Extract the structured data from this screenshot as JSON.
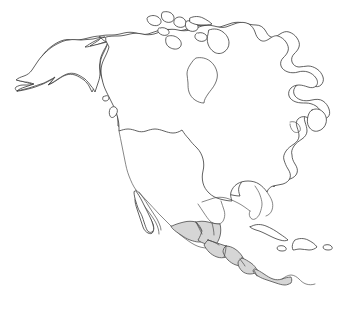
{
  "figure": {
    "type": "blank-political-map",
    "width": 346,
    "height": 320,
    "background_color": "#ffffff",
    "outline_color": "#3a3a3a",
    "highlight_color": "#d6d6d6",
    "border_color": "#555555",
    "projection_note": "continental outline, no labels"
  },
  "legend": {
    "has_legend": false,
    "has_labels": false,
    "has_title_text": false,
    "has_scale_bar": false,
    "has_compass": false,
    "has_graticule": false
  },
  "regions": [
    {
      "id": "alaska",
      "name": "Alaska",
      "shaded": false,
      "note": "northwest landmass with Aleutian peninsula tail extending southwest"
    },
    {
      "id": "canada",
      "name": "Canada",
      "shaded": false,
      "note": "largest northern landmass containing Hudson Bay"
    },
    {
      "id": "united-states",
      "name": "United States",
      "shaded": false,
      "note": "separated from Canada by straight 49th parallel border line"
    },
    {
      "id": "mexico",
      "name": "Mexico",
      "shaded": false,
      "note": "includes Baja California peninsula and Yucatan peninsula"
    },
    {
      "id": "central-america",
      "name": "Central America",
      "shaded": true,
      "note": "highlighted gray isthmus from southern Mexico through Panama"
    },
    {
      "id": "greenland-fringe",
      "name": "Arctic Archipelago",
      "shaded": false,
      "note": "cluster of small Canadian Arctic islands along the top edge"
    }
  ],
  "highlighted_countries": [
    "Guatemala",
    "Belize",
    "Honduras",
    "El Salvador",
    "Nicaragua",
    "Costa Rica",
    "Panama"
  ],
  "water_features": [
    {
      "id": "hudson-bay",
      "name": "Hudson Bay"
    },
    {
      "id": "great-lakes",
      "name": "Great Lakes"
    },
    {
      "id": "gulf-of-mexico",
      "name": "Gulf of Mexico"
    },
    {
      "id": "gulf-of-california",
      "name": "Gulf of California"
    },
    {
      "id": "caribbean-sea",
      "name": "Caribbean Sea"
    }
  ],
  "islands": [
    {
      "id": "cuba",
      "name": "Cuba",
      "shaded": false
    },
    {
      "id": "jamaica",
      "name": "Jamaica",
      "shaded": false
    },
    {
      "id": "hispaniola",
      "name": "Hispaniola",
      "shaded": false
    },
    {
      "id": "puerto-rico",
      "name": "Puerto Rico",
      "shaded": false
    },
    {
      "id": "newfoundland",
      "name": "Newfoundland",
      "shaded": false
    },
    {
      "id": "vancouver-island",
      "name": "Vancouver Island",
      "shaded": false
    },
    {
      "id": "baffin-island",
      "name": "Baffin Island",
      "shaded": false
    }
  ]
}
